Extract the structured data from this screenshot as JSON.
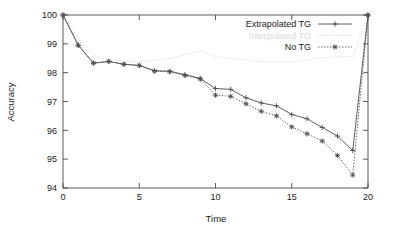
{
  "chart_data": {
    "type": "line",
    "title": "",
    "xlabel": "Time",
    "ylabel": "Accuracy",
    "xlim": [
      0,
      20
    ],
    "ylim": [
      94,
      100
    ],
    "xticks": [
      0,
      5,
      10,
      15,
      20
    ],
    "yticks": [
      94,
      95,
      96,
      97,
      98,
      99,
      100
    ],
    "grid": false,
    "legend_position": "top-right",
    "x": [
      0,
      1,
      2,
      3,
      4,
      5,
      6,
      7,
      8,
      9,
      10,
      11,
      12,
      13,
      14,
      15,
      16,
      17,
      18,
      19,
      20
    ],
    "series": [
      {
        "name": "Extrapolated TG",
        "marker": "plus",
        "line_style": "solid",
        "color": "#4d4d4d",
        "values": [
          100,
          98.95,
          98.33,
          98.39,
          98.29,
          98.25,
          98.07,
          98.05,
          97.93,
          97.8,
          97.45,
          97.42,
          97.13,
          96.95,
          96.85,
          96.55,
          96.4,
          96.1,
          95.8,
          95.3,
          100
        ]
      },
      {
        "name": "Interpolated TG",
        "marker": "none",
        "line_style": "dotted",
        "color": "#d8d8d8",
        "values": [
          100,
          99.2,
          98.6,
          98.45,
          98.4,
          98.38,
          98.42,
          98.5,
          98.62,
          98.75,
          98.55,
          98.5,
          98.45,
          98.38,
          98.37,
          98.38,
          98.45,
          98.52,
          98.55,
          98.56,
          100
        ]
      },
      {
        "name": "No TG",
        "marker": "star",
        "line_style": "dotted",
        "color": "#4d4d4d",
        "values": [
          100,
          98.95,
          98.33,
          98.39,
          98.29,
          98.25,
          98.05,
          98.03,
          97.9,
          97.78,
          97.22,
          97.18,
          96.92,
          96.66,
          96.5,
          96.12,
          95.88,
          95.63,
          95.13,
          94.45,
          100
        ]
      }
    ]
  },
  "axes": {
    "xlabel": "Time",
    "ylabel": "Accuracy",
    "xtick_labels": [
      "0",
      "5",
      "10",
      "15",
      "20"
    ],
    "ytick_labels": [
      "94",
      "95",
      "96",
      "97",
      "98",
      "99",
      "100"
    ]
  },
  "legend": {
    "entries": [
      {
        "label": "Extrapolated TG"
      },
      {
        "label": "Interpolated TG"
      },
      {
        "label": "No TG"
      }
    ]
  },
  "colors": {
    "axis": "#4a4a4a",
    "text": "#1a1a1a",
    "series_dark": "#4d4d4d",
    "series_faint": "#d8d8d8",
    "background": "#ffffff"
  }
}
